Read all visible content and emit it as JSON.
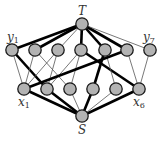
{
  "diagram": {
    "node_fill": "#b3b3b3",
    "node_stroke": "#1a1a1a",
    "thin_edge_color": "#555555",
    "thick_edge_color": "#000000",
    "nodes": {
      "T": {
        "x": 82,
        "y": 24,
        "label": "T"
      },
      "S": {
        "x": 82,
        "y": 116,
        "label": "S"
      },
      "y": [
        {
          "x": 12,
          "y": 50,
          "label": "y",
          "sub": "1"
        },
        {
          "x": 35,
          "y": 50
        },
        {
          "x": 58,
          "y": 50
        },
        {
          "x": 81,
          "y": 50
        },
        {
          "x": 105,
          "y": 50
        },
        {
          "x": 127,
          "y": 50
        },
        {
          "x": 150,
          "y": 50,
          "label": "y",
          "sub": "7"
        }
      ],
      "x": [
        {
          "x": 24,
          "y": 89,
          "label": "x",
          "sub": "1"
        },
        {
          "x": 47,
          "y": 89
        },
        {
          "x": 70,
          "y": 89
        },
        {
          "x": 93,
          "y": 89
        },
        {
          "x": 116,
          "y": 89
        },
        {
          "x": 139,
          "y": 89,
          "label": "x",
          "sub": "6"
        }
      ]
    },
    "edges": [
      {
        "from": "T",
        "to": "y1",
        "thick": true
      },
      {
        "from": "T",
        "to": "y2",
        "thick": true
      },
      {
        "from": "T",
        "to": "y3",
        "thick": false
      },
      {
        "from": "T",
        "to": "y4",
        "thick": true
      },
      {
        "from": "T",
        "to": "y5",
        "thick": true
      },
      {
        "from": "T",
        "to": "y6",
        "thick": true
      },
      {
        "from": "T",
        "to": "y7",
        "thick": false
      },
      {
        "from": "y1",
        "to": "x1",
        "thick": false
      },
      {
        "from": "y1",
        "to": "x2",
        "thick": true
      },
      {
        "from": "y2",
        "to": "x1",
        "thick": false
      },
      {
        "from": "y2",
        "to": "x3",
        "thick": false
      },
      {
        "from": "y3",
        "to": "x1",
        "thick": false
      },
      {
        "from": "y3",
        "to": "x2",
        "thick": false
      },
      {
        "from": "y4",
        "to": "x2",
        "thick": false
      },
      {
        "from": "y4",
        "to": "x3",
        "thick": false
      },
      {
        "from": "y4",
        "to": "x6",
        "thick": true
      },
      {
        "from": "y5",
        "to": "x4",
        "thick": true
      },
      {
        "from": "y5",
        "to": "x5",
        "thick": false
      },
      {
        "from": "y6",
        "to": "x1",
        "thick": true
      },
      {
        "from": "y6",
        "to": "x6",
        "thick": false
      },
      {
        "from": "y7",
        "to": "x6",
        "thick": false
      },
      {
        "from": "x1",
        "to": "S",
        "thick": true
      },
      {
        "from": "x2",
        "to": "S",
        "thick": true
      },
      {
        "from": "x3",
        "to": "S",
        "thick": false
      },
      {
        "from": "x4",
        "to": "S",
        "thick": true
      },
      {
        "from": "x5",
        "to": "S",
        "thick": false
      },
      {
        "from": "x6",
        "to": "S",
        "thick": true
      }
    ]
  }
}
